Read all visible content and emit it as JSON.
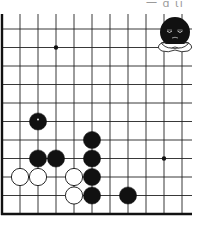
{
  "header": {
    "cropped_caption_fragment": "一 ɑ ιı"
  },
  "board": {
    "background": "#ffffff",
    "line_color": "#222222",
    "border_color": "#111111",
    "origin_x": 2,
    "origin_y": 29,
    "spacing_x": 18,
    "spacing_y": 18.5,
    "columns": 11,
    "rows": 11,
    "left_edge_is_border": true,
    "bottom_edge_is_border": true,
    "star_points": [
      [
        3,
        1
      ],
      [
        9,
        7
      ]
    ],
    "stones": [
      {
        "color": "black",
        "col": 2,
        "row": 5,
        "last_move": true
      },
      {
        "color": "black",
        "col": 5,
        "row": 6
      },
      {
        "color": "black",
        "col": 2,
        "row": 7
      },
      {
        "color": "black",
        "col": 3,
        "row": 7
      },
      {
        "color": "black",
        "col": 5,
        "row": 7
      },
      {
        "color": "white",
        "col": 1,
        "row": 8
      },
      {
        "color": "white",
        "col": 2,
        "row": 8
      },
      {
        "color": "white",
        "col": 4,
        "row": 8
      },
      {
        "color": "black",
        "col": 5,
        "row": 8
      },
      {
        "color": "white",
        "col": 4,
        "row": 9
      },
      {
        "color": "black",
        "col": 5,
        "row": 9
      },
      {
        "color": "black",
        "col": 7,
        "row": 9
      }
    ]
  },
  "mascot": {
    "name": "black-stone-character",
    "expression": "sleepy-frown",
    "arms": "crossed",
    "x": 175,
    "y": 35
  }
}
